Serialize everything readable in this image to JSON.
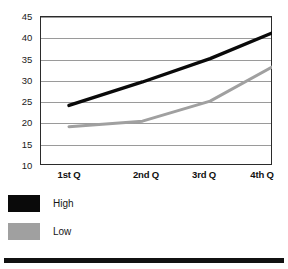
{
  "chart_data": {
    "type": "line",
    "title": "",
    "xlabel": "",
    "ylabel": "",
    "categories": [
      "1st Q",
      "2nd Q",
      "3rd Q",
      "4th Q"
    ],
    "series": [
      {
        "name": "High",
        "color": "#0a0a0a",
        "values": [
          24,
          29.5,
          35,
          41
        ]
      },
      {
        "name": "Low",
        "color": "#a0a0a0",
        "values": [
          19,
          20.3,
          25,
          33
        ]
      }
    ],
    "ylim": [
      10,
      45
    ],
    "yticks": [
      10,
      15,
      20,
      25,
      30,
      35,
      40,
      45
    ],
    "ytick_labels": [
      "10",
      "15",
      "20",
      "25",
      "30",
      "35",
      "40",
      "45"
    ],
    "grid": true,
    "grid_color": "#9a9a9a",
    "legend_position": "below-left",
    "plot_background": "#ffffff",
    "frame_color": "#2b2b2b"
  },
  "legend": {
    "items": [
      {
        "label": "High",
        "color": "#0a0a0a"
      },
      {
        "label": "Low",
        "color": "#a0a0a0"
      }
    ]
  }
}
